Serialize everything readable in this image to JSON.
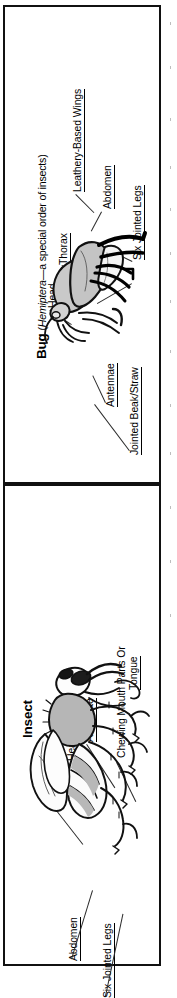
{
  "document": {
    "type": "educational-comparison-diagram",
    "orientation": "rotated-90-counterclockwise",
    "background_color": "#ffffff",
    "border_color": "#111111"
  },
  "panels": [
    {
      "id": "bug",
      "title_main": "Bug",
      "title_paren_open": " (",
      "title_scientific": "Hemiptera",
      "title_rest": "—a special order of insects)",
      "title_full": "Bug (Hemiptera—a special order of insects)",
      "illustration": "side-view-line-drawing-of-a-true-bug-with-shaded-leathery-forewings",
      "labels": [
        {
          "id": "head",
          "text": "Head"
        },
        {
          "id": "thorax",
          "text": "Thorax"
        },
        {
          "id": "wings",
          "text": "Leathery-Based Wings"
        },
        {
          "id": "abdomen",
          "text": "Abdomen"
        },
        {
          "id": "legs",
          "text": "Six Jointed Legs"
        },
        {
          "id": "antennae",
          "text": "Antennae"
        },
        {
          "id": "beak",
          "text": "Jointed Beak/Straw"
        }
      ]
    },
    {
      "id": "insect",
      "title_main": "Insect",
      "title_full": "Insect",
      "illustration": "side-view-line-drawing-of-a-generic-insect-wasp-fly-with-veined-wings-and-banded-abdomen",
      "labels": [
        {
          "id": "thorax",
          "text": "Thorax"
        },
        {
          "id": "head",
          "text": "Head"
        },
        {
          "id": "antennae",
          "text": "Antennae"
        },
        {
          "id": "mouth",
          "text": "Chewing Mouth Parts Or Tongue"
        },
        {
          "id": "mouth_line1",
          "text": "Chewing Mouth Parts Or"
        },
        {
          "id": "mouth_line2",
          "text": "Tongue"
        },
        {
          "id": "abdomen",
          "text": "Abdomen"
        },
        {
          "id": "legs",
          "text": "Six Jointed Legs"
        }
      ]
    }
  ]
}
